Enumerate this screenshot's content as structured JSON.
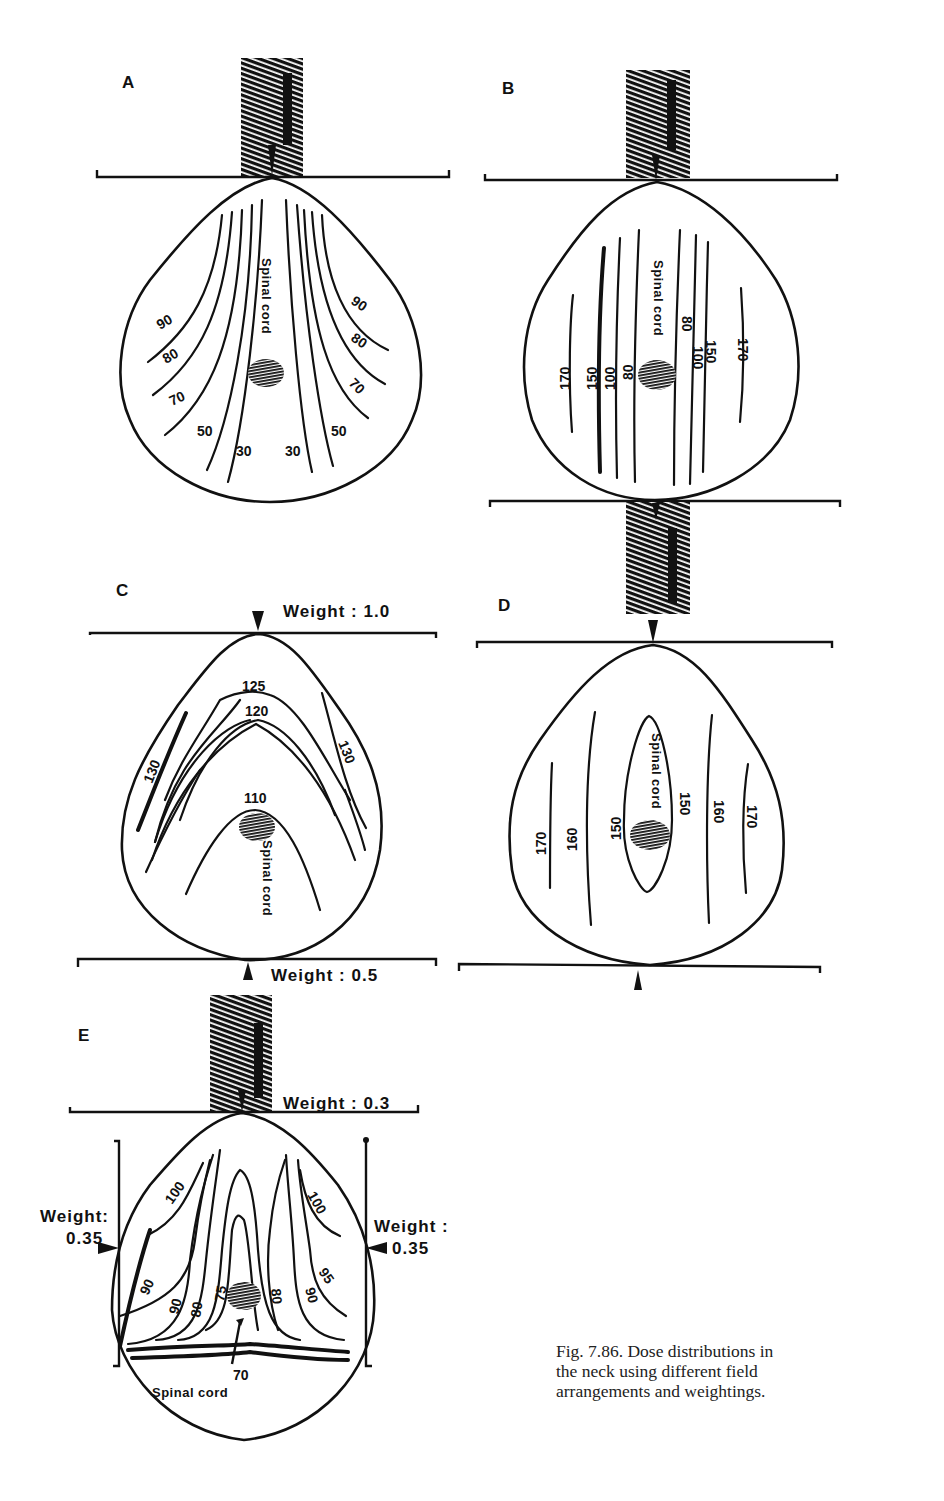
{
  "figure": {
    "panels": {
      "A": {
        "letter": "A",
        "block_label": "BLOCK",
        "cord_label": "Spinal cord",
        "isodose_left": [
          "90",
          "80",
          "70",
          "50",
          "30"
        ],
        "isodose_right": [
          "90",
          "80",
          "70",
          "50",
          "30"
        ]
      },
      "B": {
        "letter": "B",
        "block_label": "BLOCK",
        "cord_label": "Spinal cord",
        "isodose_left": [
          "170",
          "150",
          "100",
          "80"
        ],
        "isodose_right": [
          "80",
          "100",
          "150",
          "170"
        ]
      },
      "C": {
        "letter": "C",
        "weight_top": "Weight : 1.0",
        "weight_bottom": "Weight : 0.5",
        "cord_label": "Spinal cord",
        "isodose": [
          "125",
          "120",
          "110",
          "130",
          "130"
        ]
      },
      "D": {
        "letter": "D",
        "cord_label": "Spinal cord",
        "isodose_left": [
          "170",
          "160",
          "150"
        ],
        "isodose_right": [
          "150",
          "160",
          "170"
        ]
      },
      "E": {
        "letter": "E",
        "block_label": "BLOCK",
        "weight_top": "Weight : 0.3",
        "weight_left_label": "Weight:",
        "weight_left_value": "0.35",
        "weight_right_label": "Weight :",
        "weight_right_value": "0.35",
        "cord_label": "Spinal cord",
        "isodose_left": [
          "100",
          "90",
          "90",
          "80",
          "75"
        ],
        "isodose_right": [
          "100",
          "95",
          "90",
          "80"
        ],
        "isodose_bottom": "70"
      }
    },
    "caption": {
      "line1": "Fig. 7.86.  Dose distributions in",
      "line2": "the  neck  using  different  field",
      "line3": "arrangements and weightings."
    }
  }
}
